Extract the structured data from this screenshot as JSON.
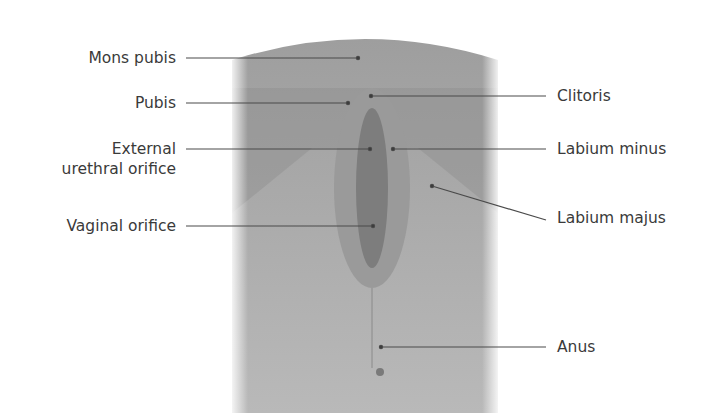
{
  "figure": {
    "type": "anatomical-diagram",
    "illustration": "stylized grayscale panel (external female genitalia, anterior view)",
    "colors": {
      "panel": "#a9a9a9",
      "panel_dark": "#8c8c8c",
      "line": "#4a4a4a",
      "text": "#3a3a3a"
    }
  },
  "labels": {
    "left": [
      {
        "id": "mons-pubis",
        "text": "Mons pubis"
      },
      {
        "id": "pubis",
        "text": "Pubis"
      },
      {
        "id": "external-urethral-orifice",
        "line1": "External",
        "line2": "urethral orifice"
      },
      {
        "id": "vaginal-orifice",
        "text": "Vaginal orifice"
      }
    ],
    "right": [
      {
        "id": "clitoris",
        "text": "Clitoris"
      },
      {
        "id": "labium-minus",
        "text": "Labium minus"
      },
      {
        "id": "labium-majus",
        "text": "Labium majus"
      },
      {
        "id": "anus",
        "text": "Anus"
      }
    ]
  }
}
